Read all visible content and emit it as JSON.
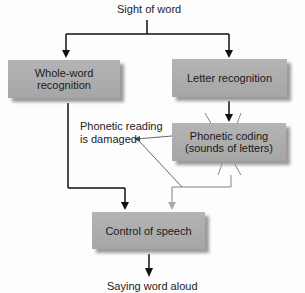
{
  "diagram": {
    "top_label": "Sight of word",
    "bottom_label": "Saying word aloud",
    "nodes": {
      "whole_word": "Whole-word recognition",
      "letter": "Letter recognition",
      "phonetic_line1": "Phonetic coding",
      "phonetic_line2": "(sounds of letters)",
      "speech": "Control of speech"
    },
    "annotation_line1": "Phonetic reading",
    "annotation_line2": "is damaged",
    "colors": {
      "box": "#a9a9a9",
      "arrow": "#111111",
      "disabled_arrow": "#b0b0b0"
    }
  }
}
